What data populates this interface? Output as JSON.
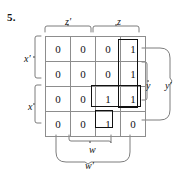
{
  "figure": {
    "problem_number": "5.",
    "type": "karnaugh-map",
    "variables": [
      "w",
      "x",
      "y",
      "z"
    ]
  },
  "grid": {
    "rows": 4,
    "cols": 4,
    "cells": [
      [
        "0",
        "0",
        "0",
        "1"
      ],
      [
        "0",
        "0",
        "0",
        "1"
      ],
      [
        "0",
        "0",
        "1",
        "1"
      ],
      [
        "0",
        "0",
        "1",
        "0"
      ]
    ]
  },
  "labels": {
    "top_left": "z′",
    "top_right": "z",
    "left_upper": "x′",
    "left_lower": "x",
    "right_inner": "y",
    "right_outer": "y′",
    "bottom_inner": "w",
    "bottom_outer": "w′"
  },
  "implicants": [
    {
      "name": "vertical-group",
      "cells": "column 4, rows 1-3",
      "values": [
        "1",
        "1",
        "1"
      ]
    },
    {
      "name": "horizontal-pair",
      "cells": "row 3, columns 3-4",
      "values": [
        "1",
        "1"
      ]
    },
    {
      "name": "single-cell",
      "cells": "row 4, column 3",
      "values": [
        "1"
      ]
    }
  ],
  "colors": {
    "grid_line": "#8d8d8d",
    "implicant_outline": "#111111",
    "bracket": "#6e6e6e",
    "text": "#111111",
    "background": "#ffffff"
  }
}
